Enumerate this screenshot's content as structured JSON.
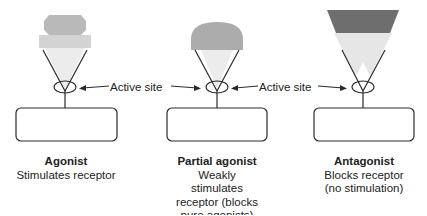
{
  "diagram": {
    "type": "receptor-ligand comparison",
    "labels": {
      "active_site_left": "Active site",
      "active_site_right": "Active site"
    },
    "panels": [
      {
        "id": "agonist",
        "title": "Agonist",
        "description": "Stimulates receptor",
        "ligand_shape": "hexagon-block",
        "ligand_color": "#b8b8b8"
      },
      {
        "id": "partial-agonist",
        "title": "Partial agonist",
        "description": "Weakly stimulates receptor (blocks pure agonists)",
        "ligand_shape": "dome",
        "ligand_color": "#a9a9a9"
      },
      {
        "id": "antagonist",
        "title": "Antagonist",
        "description": "Blocks receptor (no stimulation)",
        "ligand_shape": "trapezoid-over-triangle",
        "ligand_color": "#6e6e6e"
      }
    ],
    "colors": {
      "line": "#2a2a2a",
      "light_fill": "#e4e4e4",
      "mid_fill": "#b5b5b5",
      "dark_fill": "#6a6a6a"
    }
  }
}
